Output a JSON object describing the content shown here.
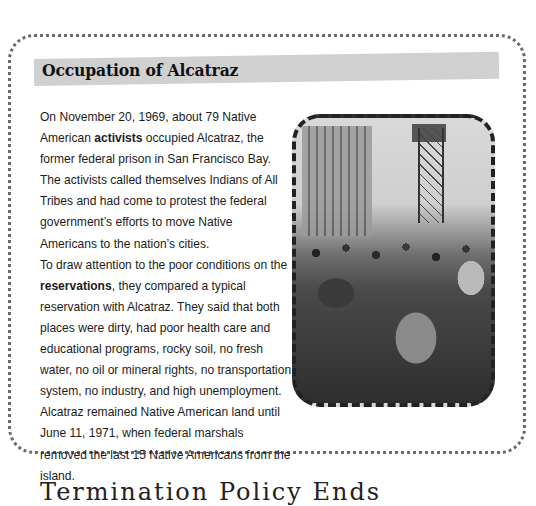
{
  "sidebar_box": {
    "title": "Occupation of Alcatraz",
    "paragraphs": [
      {
        "segments": [
          {
            "text": "On November 20, 1969, about 79 Native American ",
            "bold": false
          },
          {
            "text": "activists",
            "bold": true
          },
          {
            "text": " occupied Alcatraz, the former federal prison in San Francisco Bay. The activists called themselves Indians of All Tribes and had come to protest the federal government’s efforts to move Native Americans to the nation’s cities.",
            "bold": false
          }
        ]
      },
      {
        "segments": [
          {
            "text": "To draw attention to the poor conditions on the ",
            "bold": false
          },
          {
            "text": "reservations",
            "bold": true
          },
          {
            "text": ", they compared a typical reservation with Alcatraz. They said that both places were dirty, had poor health care and educational programs, rocky soil, no fresh water, no oil or mineral rights, no transportation system, no industry, and high unemployment. Alcatraz remained Native American land until June 11, 1971, when federal marshals removed the last 15 Native Americans from the island.",
            "bold": false
          }
        ]
      }
    ],
    "photo": {
      "alt": "Black-and-white photo of Native American activists gathered on Alcatraz Island with the prison building and guard tower behind them"
    }
  },
  "next_section": {
    "heading_partial": "Termination Policy Ends"
  }
}
